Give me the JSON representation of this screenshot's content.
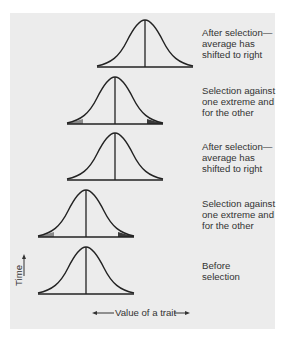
{
  "figure": {
    "panel_color": "#ececec",
    "line_color": "#222222",
    "tail_light_color": "#8a8a8a",
    "tail_dark_color": "#3a3a3a",
    "stages": [
      {
        "order": 5,
        "label": "After selection—\naverage has\nshifted to right",
        "curve_center_x": 145,
        "baseline_y": 67,
        "shaded_tails": false
      },
      {
        "order": 4,
        "label": "Selection against\none extreme and\nfor the other",
        "curve_center_x": 115,
        "baseline_y": 124,
        "shaded_tails": true
      },
      {
        "order": 3,
        "label": "After selection—\naverage has\nshifted to right",
        "curve_center_x": 115,
        "baseline_y": 180,
        "shaded_tails": false
      },
      {
        "order": 2,
        "label": "Selection against\none extreme and\nfor the other",
        "curve_center_x": 86,
        "baseline_y": 237,
        "shaded_tails": true
      },
      {
        "order": 1,
        "label": "Before\nselection",
        "curve_center_x": 86,
        "baseline_y": 294,
        "shaded_tails": false
      }
    ],
    "y_axis_label": "Time",
    "x_axis_label": "Value of a trait"
  }
}
